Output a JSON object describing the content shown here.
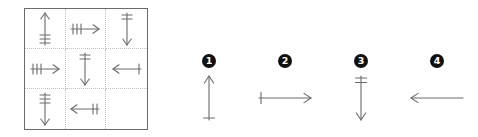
{
  "puzzle": {
    "type": "matrix-reasoning",
    "stroke_color": "#6b6b6b",
    "border_color": "#6b6b6b",
    "divider_color": "#c2c2c2",
    "badge_color": "#111111",
    "badge_text_color": "#ffffff"
  },
  "matrix": {
    "rows": 3,
    "columns": 3,
    "cells": [
      {
        "id": "cell-r1c1",
        "row": 1,
        "col": 1,
        "direction": "up",
        "ticks": 3,
        "empty": false,
        "label": "up arrow with 3 ticks"
      },
      {
        "id": "cell-r1c2",
        "row": 1,
        "col": 2,
        "direction": "right",
        "ticks": 3,
        "empty": false,
        "label": "right arrow with 3 ticks"
      },
      {
        "id": "cell-r1c3",
        "row": 1,
        "col": 3,
        "direction": "down",
        "ticks": 2,
        "empty": false,
        "label": "down arrow with 2 ticks"
      },
      {
        "id": "cell-r2c1",
        "row": 2,
        "col": 1,
        "direction": "right",
        "ticks": 3,
        "empty": false,
        "label": "right arrow with 3 ticks"
      },
      {
        "id": "cell-r2c2",
        "row": 2,
        "col": 2,
        "direction": "down",
        "ticks": 2,
        "empty": false,
        "label": "down arrow with 2 ticks"
      },
      {
        "id": "cell-r2c3",
        "row": 2,
        "col": 3,
        "direction": "left",
        "ticks": 1,
        "empty": false,
        "label": "left arrow with 1 tick"
      },
      {
        "id": "cell-r3c1",
        "row": 3,
        "col": 1,
        "direction": "down",
        "ticks": 3,
        "empty": false,
        "label": "down arrow with 3 ticks"
      },
      {
        "id": "cell-r3c2",
        "row": 3,
        "col": 2,
        "direction": "left",
        "ticks": 2,
        "empty": false,
        "label": "left arrow with 2 ticks"
      },
      {
        "id": "cell-r3c3",
        "row": 3,
        "col": 3,
        "direction": null,
        "ticks": 0,
        "empty": true,
        "label": "empty cell - missing piece"
      }
    ]
  },
  "options": [
    {
      "id": "option-1",
      "number": "1",
      "direction": "up",
      "ticks": 1,
      "label": "up arrow with 1 tick"
    },
    {
      "id": "option-2",
      "number": "2",
      "direction": "right",
      "ticks": 1,
      "label": "right arrow with 1 tick"
    },
    {
      "id": "option-3",
      "number": "3",
      "direction": "down",
      "ticks": 2,
      "label": "down arrow with 2 ticks"
    },
    {
      "id": "option-4",
      "number": "4",
      "direction": "left",
      "ticks": 0,
      "label": "left arrow with no ticks"
    }
  ]
}
